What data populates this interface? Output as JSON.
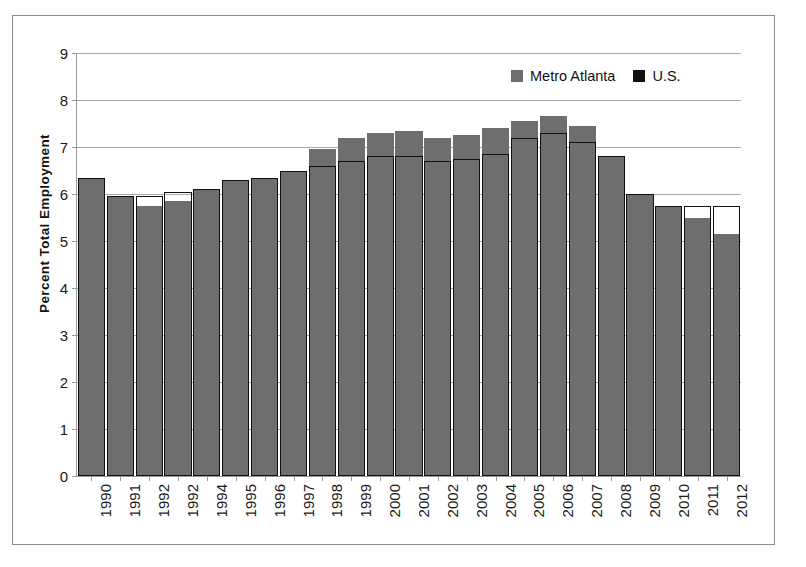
{
  "chart_data": {
    "type": "bar",
    "title": "",
    "xlabel": "",
    "ylabel": "Percent Total Employment",
    "ylim": [
      0,
      9
    ],
    "ytick_labels": [
      "0",
      "1",
      "2",
      "3",
      "4",
      "5",
      "6",
      "7",
      "8",
      "9"
    ],
    "ytick_values": [
      0,
      1,
      2,
      3,
      4,
      5,
      6,
      7,
      8,
      9
    ],
    "grid": true,
    "legend_position": "top-right",
    "categories": [
      "1990",
      "1991",
      "1992",
      "1992",
      "1994",
      "1995",
      "1996",
      "1997",
      "1998",
      "1999",
      "2000",
      "2001",
      "2002",
      "2003",
      "2004",
      "2005",
      "2006",
      "2007",
      "2008",
      "2009",
      "2010",
      "2011",
      "2012"
    ],
    "series": [
      {
        "name": "Metro Atlanta",
        "color": "#6e6e6e",
        "values": [
          6.35,
          5.95,
          5.75,
          5.85,
          6.1,
          6.3,
          6.35,
          6.5,
          6.95,
          7.2,
          7.3,
          7.35,
          7.2,
          7.25,
          7.4,
          7.55,
          7.65,
          7.45,
          6.8,
          6.0,
          5.75,
          5.5,
          5.15
        ]
      },
      {
        "name": "U.S.",
        "color": "#101010",
        "values": [
          6.35,
          5.95,
          5.95,
          6.05,
          6.1,
          6.3,
          6.35,
          6.5,
          6.6,
          6.7,
          6.8,
          6.8,
          6.7,
          6.75,
          6.85,
          7.2,
          7.3,
          7.1,
          6.8,
          6.0,
          5.75,
          5.75,
          5.75
        ]
      }
    ]
  },
  "legend": {
    "items": [
      {
        "label": "Metro Atlanta",
        "swatch": "gray-swatch-icon"
      },
      {
        "label": "U.S.",
        "swatch": "black-swatch-icon"
      }
    ]
  }
}
